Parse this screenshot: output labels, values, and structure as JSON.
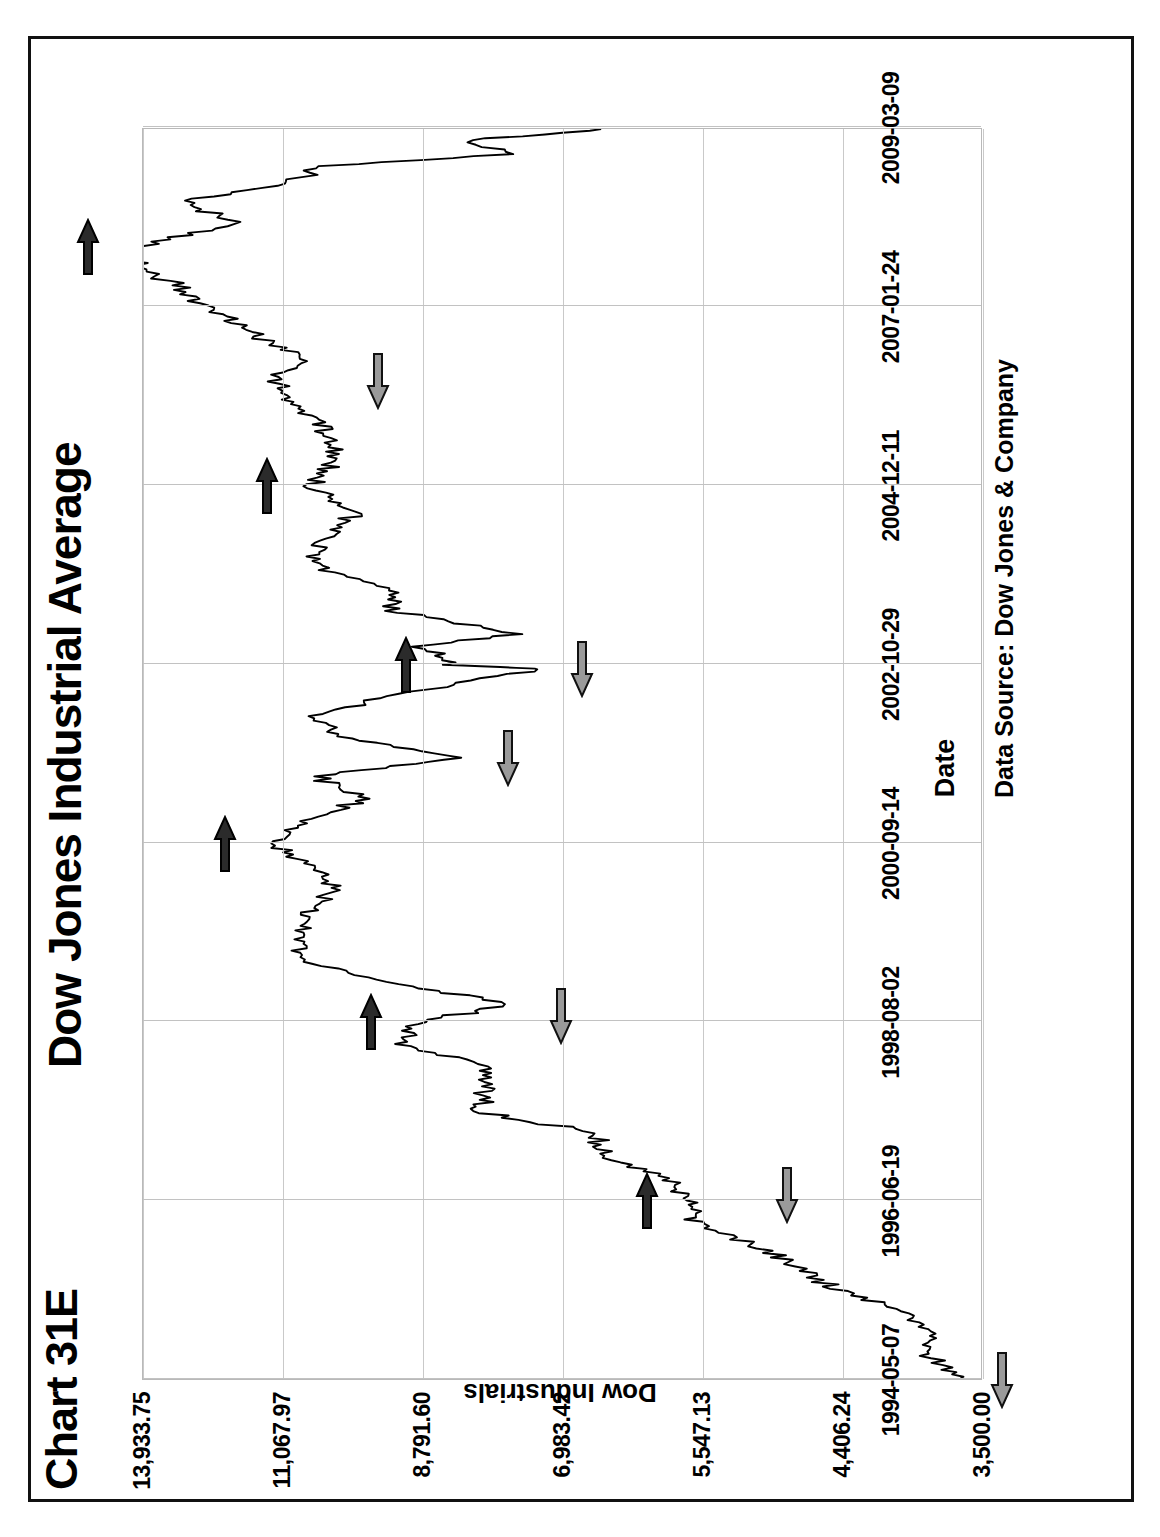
{
  "figure": {
    "chart_number": "Chart 31E",
    "title": "Dow Jones Industrial Average",
    "source_note": "Data Source:  Dow Jones & Company"
  },
  "axes": {
    "x_title": "Date",
    "y_title": "Dow Industrials",
    "x_ticks": [
      "1994-05-07",
      "1996-06-19",
      "1998-08-02",
      "2000-09-14",
      "2002-10-29",
      "2004-12-11",
      "2007-01-24",
      "2009-03-09"
    ],
    "y_ticks": [
      "3,500.00",
      "4,406.24",
      "5,547.13",
      "6,983.42",
      "8,791.60",
      "11,067.97",
      "13,933.75"
    ]
  },
  "chart_data": {
    "type": "line",
    "title": "Dow Jones Industrial Average",
    "xlabel": "Date",
    "ylabel": "Dow Industrials",
    "yscale": "log",
    "ylim": [
      3500.0,
      13933.75
    ],
    "y_tick_values": [
      3500.0,
      4406.24,
      5547.13,
      6983.42,
      8791.6,
      11067.97,
      13933.75
    ],
    "y_tick_labels": [
      "3,500.00",
      "4,406.24",
      "5,547.13",
      "6,983.42",
      "8,791.60",
      "11,067.97",
      "13,933.75"
    ],
    "x_tick_labels": [
      "1994-05-07",
      "1996-06-19",
      "1998-08-02",
      "2000-09-14",
      "2002-10-29",
      "2004-12-11",
      "2007-01-24",
      "2009-03-09"
    ],
    "grid": true,
    "legend": "none",
    "series": [
      {
        "name": "Dow Industrials",
        "x": [
          "1994-05-07",
          "1994-08-15",
          "1994-11-20",
          "1995-02-25",
          "1995-06-02",
          "1995-09-07",
          "1995-12-13",
          "1996-03-19",
          "1996-06-19",
          "1996-09-24",
          "1996-12-30",
          "1997-04-06",
          "1997-07-12",
          "1997-10-17",
          "1998-01-22",
          "1998-04-29",
          "1998-08-02",
          "1998-10-18",
          "1999-01-23",
          "1999-04-30",
          "1999-08-05",
          "1999-11-10",
          "2000-02-15",
          "2000-05-22",
          "2000-09-14",
          "2000-12-20",
          "2001-03-27",
          "2001-07-02",
          "2001-09-21",
          "2001-12-13",
          "2002-03-20",
          "2002-06-25",
          "2002-10-09",
          "2002-10-29",
          "2003-01-15",
          "2003-03-11",
          "2003-06-20",
          "2003-09-26",
          "2004-01-02",
          "2004-04-09",
          "2004-08-13",
          "2004-12-11",
          "2005-04-20",
          "2005-08-26",
          "2005-12-02",
          "2006-03-10",
          "2006-06-16",
          "2006-09-22",
          "2007-01-24",
          "2007-05-01",
          "2007-07-19",
          "2007-10-09",
          "2008-01-22",
          "2008-05-02",
          "2008-07-15",
          "2008-09-29",
          "2008-11-20",
          "2009-01-20",
          "2009-03-09"
        ],
        "y": [
          3650,
          3800,
          3780,
          3960,
          4450,
          4750,
          5100,
          5600,
          5650,
          5870,
          6550,
          6600,
          8050,
          7900,
          7900,
          9100,
          8900,
          7540,
          9300,
          10800,
          10650,
          10700,
          10200,
          10400,
          11300,
          10600,
          9700,
          10500,
          8235,
          9900,
          10600,
          9100,
          7286,
          8400,
          8800,
          7524,
          9200,
          9300,
          10450,
          10400,
          9800,
          10550,
          10100,
          10400,
          10800,
          11200,
          10700,
          11500,
          12500,
          13200,
          14000,
          14165,
          11970,
          13000,
          10960,
          10365,
          7550,
          8200,
          6547
        ]
      }
    ],
    "annotations": [
      {
        "label": "peak",
        "style": "dark-arrow",
        "date": "1996-06-19",
        "value": 5650,
        "direction": "right"
      },
      {
        "label": "peak",
        "style": "dark-arrow",
        "date": "1998-08-02",
        "value": 8900,
        "direction": "right"
      },
      {
        "label": "peak",
        "style": "dark-arrow",
        "date": "2000-09-14",
        "value": 11300,
        "direction": "right"
      },
      {
        "label": "peak",
        "style": "dark-arrow",
        "date": "2002-10-29",
        "value": 8400,
        "direction": "right"
      },
      {
        "label": "peak",
        "style": "dark-arrow",
        "date": "2004-12-11",
        "value": 10550,
        "direction": "right"
      },
      {
        "label": "peak",
        "style": "dark-arrow",
        "date": "2007-10-09",
        "value": 14165,
        "direction": "right"
      },
      {
        "label": "trough",
        "style": "light-arrow",
        "date": "1994-05-07",
        "value": 3650,
        "direction": "left"
      },
      {
        "label": "trough",
        "style": "light-arrow",
        "date": "1996-07-16",
        "value": 5200,
        "direction": "left"
      },
      {
        "label": "trough",
        "style": "light-arrow",
        "date": "1998-08-31",
        "value": 7540,
        "direction": "left"
      },
      {
        "label": "trough",
        "style": "light-arrow",
        "date": "2001-09-21",
        "value": 8235,
        "direction": "left"
      },
      {
        "label": "trough",
        "style": "light-arrow",
        "date": "2002-10-09",
        "value": 7286,
        "direction": "left"
      },
      {
        "label": "trough",
        "style": "light-arrow",
        "date": "2006-03-10",
        "value": 10200,
        "direction": "left"
      }
    ]
  },
  "colors": {
    "series_line": "#000000",
    "grid": "#c2c2c2",
    "plot_border": "#b9b9b9",
    "frame": "#111111",
    "arrow_dark": "#2b2b2b",
    "arrow_light": "#9a9a9a",
    "background": "#ffffff"
  }
}
